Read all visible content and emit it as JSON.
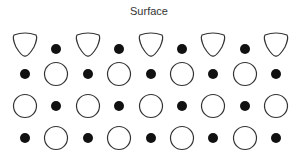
{
  "title": "Surface",
  "colors": {
    "stroke": "#333333",
    "fill_dot": "#111111",
    "background": "#ffffff"
  },
  "lattice": {
    "description": "Crystal lattice near a surface: alternating large ions (hollow) and small ions (filled); surface-layer large ions are distorted",
    "rows": [
      [
        "distorted",
        "dot",
        "distorted",
        "dot",
        "distorted",
        "dot",
        "distorted",
        "dot",
        "distorted"
      ],
      [
        "dot",
        "circle",
        "dot",
        "circle",
        "dot",
        "circle",
        "dot",
        "circle",
        "dot"
      ],
      [
        "circle",
        "dot",
        "circle",
        "dot",
        "circle",
        "dot",
        "circle",
        "dot",
        "circle"
      ],
      [
        "dot",
        "circle",
        "dot",
        "circle",
        "dot",
        "circle",
        "dot",
        "circle",
        "dot"
      ]
    ]
  }
}
